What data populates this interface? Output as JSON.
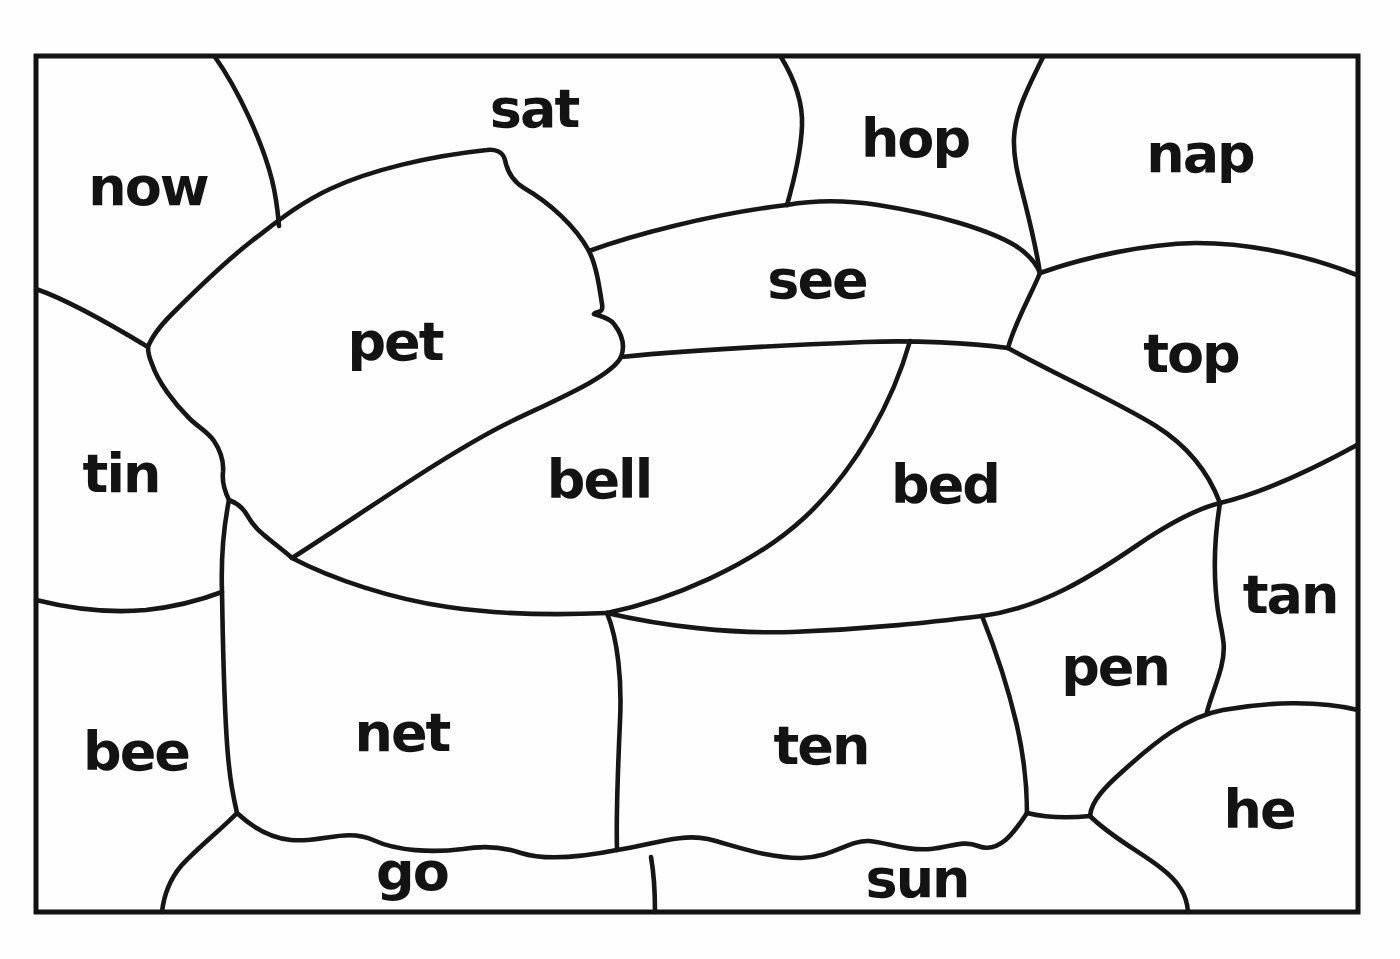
{
  "canvas": {
    "paper_color": "#fefefe",
    "ink_color": "#161616"
  },
  "regions": [
    {
      "id": "now",
      "word": "now"
    },
    {
      "id": "sat",
      "word": "sat"
    },
    {
      "id": "hop",
      "word": "hop"
    },
    {
      "id": "nap",
      "word": "nap"
    },
    {
      "id": "pet",
      "word": "pet"
    },
    {
      "id": "see",
      "word": "see"
    },
    {
      "id": "top",
      "word": "top"
    },
    {
      "id": "tin",
      "word": "tin"
    },
    {
      "id": "bell",
      "word": "bell"
    },
    {
      "id": "bed",
      "word": "bed"
    },
    {
      "id": "tan",
      "word": "tan"
    },
    {
      "id": "bee",
      "word": "bee"
    },
    {
      "id": "net",
      "word": "net"
    },
    {
      "id": "ten",
      "word": "ten"
    },
    {
      "id": "pen",
      "word": "pen"
    },
    {
      "id": "he",
      "word": "he"
    },
    {
      "id": "go",
      "word": "go"
    },
    {
      "id": "sun",
      "word": "sun"
    }
  ]
}
